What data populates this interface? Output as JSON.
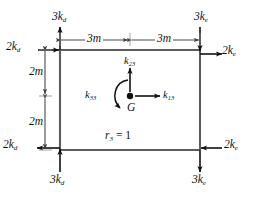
{
  "diagram": {
    "colors": {
      "frame": "#5c5c5c",
      "arrow": "#111111",
      "dimension": "#4a4a4a",
      "text": "#111111",
      "background": "#ffffff"
    },
    "geometry": {
      "frame_left": 60,
      "frame_right": 200,
      "frame_top": 50,
      "frame_bottom": 150,
      "center_x": 130,
      "center_y": 96
    }
  },
  "labels": {
    "top_left_vertical": {
      "base": "3k",
      "sub": "d"
    },
    "top_left_horizontal": {
      "base": "2k",
      "sub": "d"
    },
    "top_right_vertical": {
      "base": "3k",
      "sub": "e"
    },
    "top_right_horizontal": {
      "base": "2k",
      "sub": "e"
    },
    "bottom_left_horizontal": {
      "base": "2k",
      "sub": "d"
    },
    "bottom_left_vertical": {
      "base": "3k",
      "sub": "d"
    },
    "bottom_right_horizontal": {
      "base": "2k",
      "sub": "e"
    },
    "bottom_right_vertical": {
      "base": "3k",
      "sub": "e"
    },
    "center_up": {
      "base": "k",
      "sub": "23"
    },
    "center_right": {
      "base": "k",
      "sub": "13"
    },
    "center_moment": {
      "base": "k",
      "sub": "33"
    },
    "center_point": {
      "base": "G",
      "sub": ""
    },
    "unit_displacement": {
      "base": "r",
      "sub": "3",
      "suffix": " = 1"
    }
  },
  "dimensions": {
    "top_left_span": {
      "value": "3",
      "unit": "m"
    },
    "top_right_span": {
      "value": "3",
      "unit": "m"
    },
    "left_upper_span": {
      "value": "2",
      "unit": "m"
    },
    "left_lower_span": {
      "value": "2",
      "unit": "m"
    }
  }
}
